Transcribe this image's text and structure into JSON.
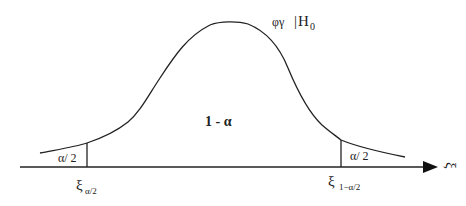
{
  "diagram": {
    "type": "two-tailed hypothesis test acceptance region",
    "distribution_label": {
      "main": "φγ",
      "condition_bar": "|",
      "hypothesis": "H",
      "hypothesis_sub": "0"
    },
    "center_region_label": "1 -  α",
    "left_tail_label": "α/ 2",
    "right_tail_label": "α/ 2",
    "left_critical": {
      "symbol": "ξ",
      "subscript": "α/2"
    },
    "right_critical": {
      "symbol": "ξ",
      "subscript": "1−α/2"
    },
    "axis_label": "ξ",
    "colors": {
      "line": "#222222",
      "background": "#ffffff"
    }
  }
}
